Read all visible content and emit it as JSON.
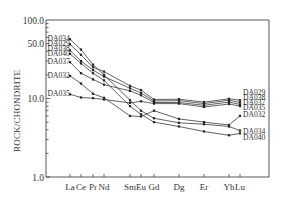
{
  "chart_data": {
    "type": "line",
    "title": "",
    "xlabel": "",
    "ylabel": "ROCK/CHONDRITE",
    "yscale": "log",
    "ylim": [
      1.0,
      100.0
    ],
    "y_ticks": [
      "100.0",
      "50.0",
      "10.0",
      "1.0"
    ],
    "categories": [
      "La",
      "Ce",
      "Pr",
      "Nd",
      "Sm",
      "Eu",
      "Gd",
      "Dy",
      "Er",
      "Yb",
      "Lu"
    ],
    "category_display": [
      "La",
      "Ce",
      "Pr",
      "Nd",
      "Sm",
      "Eu",
      "Gd",
      "Dg",
      "Er",
      "Yb",
      "Lu"
    ],
    "grid": false,
    "legend_position": "inline-labels",
    "left_labels": [
      "DA034",
      "DA029",
      "DA038",
      "DA040",
      "DA037",
      "DA032",
      "DA035"
    ],
    "right_labels": [
      "DA029",
      "DA038",
      "DA037",
      "DA035",
      "DA032",
      "DA034",
      "DA040"
    ],
    "series": [
      {
        "name": "DA034",
        "values": [
          57,
          42,
          27,
          20,
          9.5,
          7.0,
          5.6,
          4.9,
          4.7,
          4.4,
          3.9
        ]
      },
      {
        "name": "DA029",
        "values": [
          49,
          36,
          25,
          22,
          14.5,
          12.8,
          9.7,
          9.8,
          9.0,
          9.9,
          9.5
        ]
      },
      {
        "name": "DA038",
        "values": [
          41,
          30,
          23,
          19,
          13.5,
          11.8,
          9.3,
          9.4,
          8.6,
          9.5,
          8.9
        ]
      },
      {
        "name": "DA040",
        "values": [
          37,
          28,
          21,
          17,
          8.0,
          6.3,
          5.0,
          4.4,
          3.8,
          3.4,
          3.6
        ]
      },
      {
        "name": "DA037",
        "values": [
          29,
          21,
          17.5,
          15,
          12.5,
          11.0,
          8.9,
          8.9,
          8.2,
          9.0,
          8.4
        ]
      },
      {
        "name": "DA032",
        "values": [
          19.4,
          15.5,
          11.5,
          10.2,
          6.0,
          5.9,
          7.0,
          5.5,
          5.0,
          4.6,
          6.0
        ]
      },
      {
        "name": "DA035",
        "values": [
          11.3,
          10.3,
          10.1,
          9.7,
          8.8,
          9.2,
          8.6,
          8.6,
          7.8,
          8.5,
          8.0
        ]
      }
    ]
  },
  "axes": {
    "ylabel": "ROCK/CHONDRITE",
    "y_ticks": [
      "100.0",
      "50.0",
      "10.0",
      "1.0"
    ]
  }
}
